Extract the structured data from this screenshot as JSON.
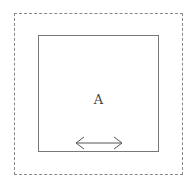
{
  "diagram": {
    "container_style": "dashed",
    "box": {
      "label": "A",
      "icon": "horizontal-double-arrow-icon"
    }
  }
}
